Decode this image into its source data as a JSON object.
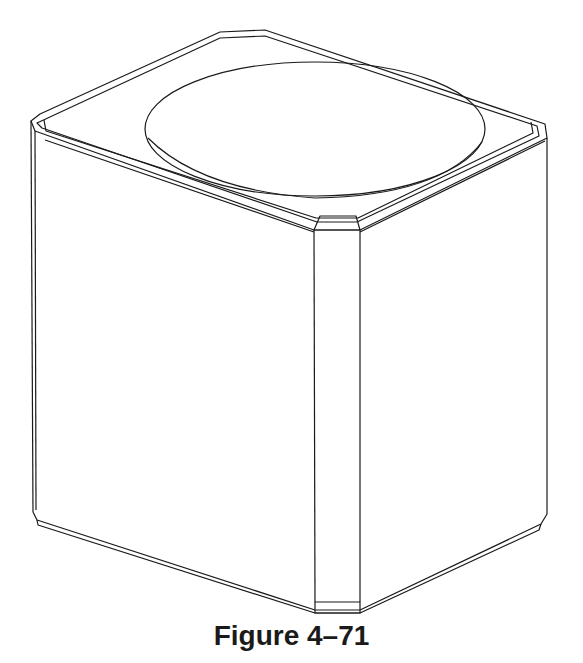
{
  "figure": {
    "caption": "Figure 4–71",
    "stroke_color": "#1a1a1a",
    "background_color": "#ffffff"
  }
}
